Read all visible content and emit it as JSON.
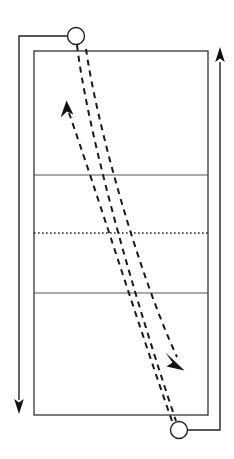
{
  "diagram": {
    "canvas": {
      "width": 234,
      "height": 459,
      "background": "#ffffff"
    },
    "colors": {
      "court_line": "#555555",
      "court_border": "#333333",
      "net_line": "#222222",
      "path_line": "#1a1a1a",
      "movement_line": "#222222",
      "player_fill": "#ffffff",
      "player_stroke": "#222222"
    },
    "court": {
      "label": "volleyball-court",
      "left": 34,
      "top": 51,
      "right": 208,
      "bottom": 415,
      "border_width": 1.3,
      "lines": [
        {
          "name": "attack-line-top",
          "y": 175,
          "style": "solid",
          "width": 1.1
        },
        {
          "name": "net-center-line",
          "y": 233,
          "style": "dotted",
          "width": 1.3
        },
        {
          "name": "attack-line-bottom",
          "y": 293,
          "style": "solid",
          "width": 1.1
        }
      ]
    },
    "players": [
      {
        "name": "player-top",
        "cx": 76,
        "cy": 36,
        "r": 8.5,
        "label": ""
      },
      {
        "name": "player-bottom",
        "cx": 179,
        "cy": 430,
        "r": 8.5,
        "label": ""
      }
    ],
    "ball_paths": [
      {
        "name": "ball-path-serve",
        "style": "dashed",
        "from": "player-top",
        "to": "player-bottom",
        "points": "76,45 100,160 140,290 176,421",
        "arrow": false
      },
      {
        "name": "ball-path-return",
        "style": "dashed",
        "from": "player-bottom",
        "to": "arrow-up",
        "points": "172,421 140,300 100,190 70,112",
        "arrow": true,
        "arrow_head": {
          "name": "arrowhead-up",
          "x": 66,
          "y": 101,
          "angle": -72
        }
      },
      {
        "name": "ball-path-attack",
        "style": "dashed",
        "from": "midcourt",
        "to": "arrow-down-right",
        "points": "86,48 110,150 150,280 178,358",
        "arrow": true,
        "arrow_head": {
          "name": "arrowhead-down-right",
          "x": 183,
          "y": 368,
          "angle": 68
        }
      }
    ],
    "movement_paths": [
      {
        "name": "movement-path-left",
        "style": "solid",
        "points": "76,36 19,36 19,400",
        "arrow": true,
        "arrow_head": {
          "name": "arrowhead-left-down",
          "x": 19,
          "y": 411,
          "angle": 90
        }
      },
      {
        "name": "movement-path-right",
        "style": "solid",
        "points": "179,430 220,430 220,62",
        "arrow": true,
        "arrow_head": {
          "name": "arrowhead-right-up",
          "x": 220,
          "y": 49,
          "angle": -90
        }
      }
    ]
  }
}
